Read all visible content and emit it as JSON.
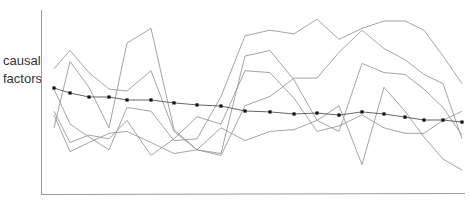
{
  "chart_data": {
    "type": "line",
    "title": "",
    "xlabel": "",
    "ylabel": "causal factors",
    "grid": false,
    "legend": null,
    "ylim": [
      0,
      100
    ],
    "x": [
      1,
      2,
      3,
      4,
      5,
      6,
      7,
      8,
      9,
      10,
      11,
      12,
      13,
      14,
      15,
      16,
      17,
      18,
      19,
      20
    ],
    "series": [
      {
        "name": "series-1",
        "style": "gray-line",
        "values": [
          68,
          78,
          66,
          57,
          56,
          67,
          34,
          24,
          21,
          48,
          53,
          63,
          63,
          77,
          89,
          79,
          73,
          65,
          60,
          30
        ]
      },
      {
        "name": "series-2",
        "style": "gray-line",
        "values": [
          36,
          72,
          58,
          36,
          82,
          90,
          35,
          24,
          22,
          75,
          78,
          62,
          40,
          34,
          71,
          66,
          65,
          57,
          47,
          32
        ]
      },
      {
        "name": "series-3",
        "style": "gray-line",
        "values": [
          57,
          38,
          31,
          24,
          47,
          45,
          29,
          30,
          53,
          86,
          89,
          87,
          95,
          84,
          90,
          94,
          94,
          89,
          75,
          60
        ]
      },
      {
        "name": "series-4",
        "style": "gray-line",
        "values": [
          43,
          23,
          28,
          33,
          34,
          28,
          22,
          24,
          36,
          29,
          34,
          35,
          40,
          48,
          16,
          58,
          45,
          31,
          19,
          13
        ]
      },
      {
        "name": "series-5",
        "style": "gray-line",
        "values": [
          45,
          28,
          32,
          30,
          40,
          21,
          30,
          42,
          38,
          67,
          66,
          52,
          34,
          37,
          43,
          36,
          33,
          33,
          40,
          45
        ]
      },
      {
        "name": "mean",
        "style": "black-dotted",
        "values": [
          57.6,
          54.9,
          52.7,
          52.7,
          51.1,
          51.1,
          49.5,
          48.4,
          47.8,
          45.1,
          44.6,
          43.5,
          44.0,
          42.9,
          44.6,
          43.5,
          41.8,
          40.2,
          40.2,
          39.1
        ]
      }
    ]
  },
  "axes": {
    "y_label_line1": "causal",
    "y_label_line2": "factors"
  },
  "colors": {
    "series_line": "#9a9a9a",
    "mean_line": "#555555",
    "mean_marker": "#111111",
    "axis": "#9a9a9a"
  }
}
